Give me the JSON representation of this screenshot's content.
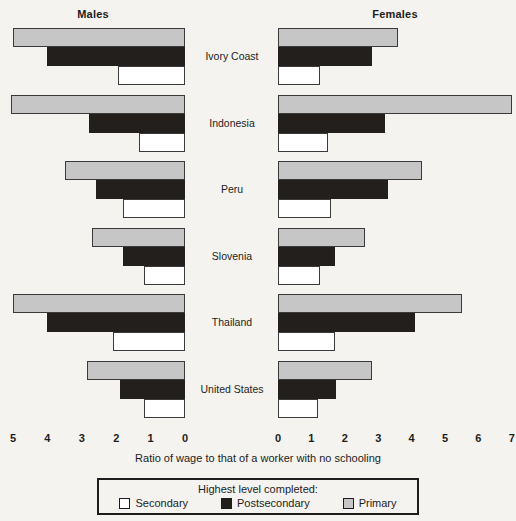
{
  "headers": {
    "males": "Males",
    "females": "Females"
  },
  "axis_caption": "Ratio of wage to that of a worker with no schooling",
  "legend": {
    "title": "Highest level completed:",
    "items": [
      {
        "label": "Secondary",
        "key": "secondary",
        "color": "#ffffff"
      },
      {
        "label": "Postsecondary",
        "key": "postsecondary",
        "color": "#231f1c"
      },
      {
        "label": "Primary",
        "key": "primary",
        "color": "#c6c6c6"
      }
    ]
  },
  "left_ticks": [
    "5",
    "4",
    "3",
    "2",
    "1",
    "0"
  ],
  "right_ticks": [
    "0",
    "1",
    "2",
    "3",
    "4",
    "5",
    "6",
    "7"
  ],
  "chart_data": {
    "type": "bar",
    "title": "",
    "xlabel": "Ratio of wage to that of a worker with no schooling",
    "ylabel": "",
    "orientation": "horizontal",
    "layout": "back-to-back pyramid",
    "grid": false,
    "legend_position": "bottom",
    "panels": [
      "Males",
      "Females"
    ],
    "xlim_left": [
      0,
      5
    ],
    "xlim_right": [
      0,
      7
    ],
    "left_axis_direction": "reversed",
    "categories": [
      "Ivory Coast",
      "Indonesia",
      "Peru",
      "Slovenia",
      "Thailand",
      "United States"
    ],
    "series": [
      {
        "name": "Primary",
        "panel": "Males",
        "color": "#c6c6c6",
        "values": [
          5.0,
          5.05,
          3.5,
          2.7,
          5.0,
          2.85
        ]
      },
      {
        "name": "Postsecondary",
        "panel": "Males",
        "color": "#231f1c",
        "values": [
          4.0,
          2.8,
          2.6,
          1.8,
          4.0,
          1.9
        ]
      },
      {
        "name": "Secondary",
        "panel": "Males",
        "color": "#ffffff",
        "values": [
          1.95,
          1.35,
          1.8,
          1.2,
          2.1,
          1.2
        ]
      },
      {
        "name": "Primary",
        "panel": "Females",
        "color": "#c6c6c6",
        "values": [
          3.6,
          7.0,
          4.3,
          2.6,
          5.5,
          2.8
        ]
      },
      {
        "name": "Postsecondary",
        "panel": "Females",
        "color": "#231f1c",
        "values": [
          2.8,
          3.2,
          3.3,
          1.7,
          4.1,
          1.75
        ]
      },
      {
        "name": "Secondary",
        "panel": "Females",
        "color": "#ffffff",
        "values": [
          1.25,
          1.5,
          1.6,
          1.25,
          1.7,
          1.2
        ]
      }
    ]
  }
}
